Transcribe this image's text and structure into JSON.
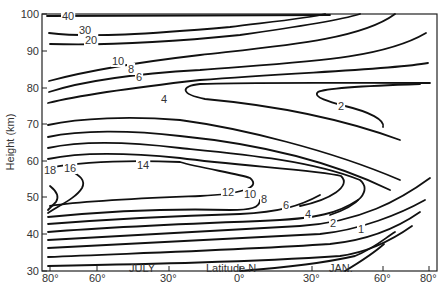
{
  "chart_data": {
    "type": "contour",
    "title": "",
    "xlabel": "Latitude N",
    "ylabel": "Height (km)",
    "x_ticks": [
      "80°",
      "60°",
      "30°",
      "0°",
      "30°",
      "60°",
      "80°"
    ],
    "x_tick_positions": [
      -80,
      -60,
      -30,
      0,
      30,
      60,
      80
    ],
    "x_annotations": [
      {
        "text": "JULY",
        "x": -40
      },
      {
        "text": "JAN.",
        "x": 40
      }
    ],
    "y_ticks": [
      "30",
      "40",
      "50",
      "60",
      "70",
      "80",
      "90",
      "100"
    ],
    "ylim": [
      30,
      100
    ],
    "xlim": [
      -82,
      82
    ],
    "grid": false,
    "contour_levels": [
      1,
      2,
      4,
      6,
      8,
      10,
      12,
      14,
      16,
      18,
      20,
      30,
      40
    ],
    "contour_labels": [
      {
        "text": "40",
        "lat": -74,
        "height": 99.5
      },
      {
        "text": "30",
        "lat": -70,
        "height": 96.5
      },
      {
        "text": "20",
        "lat": -68,
        "height": 93
      },
      {
        "text": "10",
        "lat": -44,
        "height": 85.5
      },
      {
        "text": "8",
        "lat": -40,
        "height": 83
      },
      {
        "text": "6",
        "lat": -40,
        "height": 81
      },
      {
        "text": "4",
        "lat": -22,
        "height": 76
      },
      {
        "text": "2",
        "lat": 51,
        "height": 73.5
      },
      {
        "text": "18",
        "lat": -81,
        "height": 52
      },
      {
        "text": "16",
        "lat": -72,
        "height": 52.5
      },
      {
        "text": "14",
        "lat": -21,
        "height": 52.5
      },
      {
        "text": "12",
        "lat": -4,
        "height": 45.5
      },
      {
        "text": "10",
        "lat": 5,
        "height": 44
      },
      {
        "text": "8",
        "lat": 10,
        "height": 43
      },
      {
        "text": "6",
        "lat": 22,
        "height": 40
      },
      {
        "text": "4",
        "lat": 33,
        "height": 37
      },
      {
        "text": "2",
        "lat": 41,
        "height": 33.5
      },
      {
        "text": "1",
        "lat": 57,
        "height": 35
      }
    ]
  }
}
